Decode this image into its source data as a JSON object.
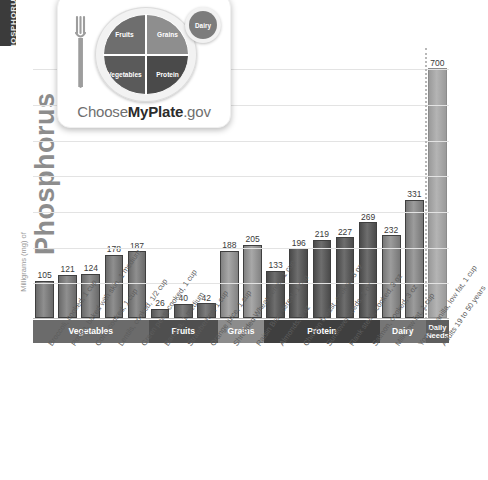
{
  "side_tab": {
    "label": "PHOSPHORUS"
  },
  "axis": {
    "y_title_main": "Phosphorus",
    "y_title_small": "Milligrams (mg) of",
    "y_max": 760,
    "gridline_step": 100,
    "gridlines": [
      100,
      200,
      300,
      400,
      500,
      600,
      700
    ]
  },
  "logo": {
    "fork_icon": "fork-icon",
    "wordmark_prefix": "Choose",
    "wordmark_bold": "MyPlate",
    "wordmark_suffix": ".gov",
    "segments": [
      {
        "name": "Fruits",
        "color": "#6e6e6e"
      },
      {
        "name": "Grains",
        "color": "#8e8e8e"
      },
      {
        "name": "Vegetables",
        "color": "#5a5a5a"
      },
      {
        "name": "Protein",
        "color": "#4a4a4a"
      },
      {
        "name": "Dairy",
        "color": "#7c7c7c"
      }
    ]
  },
  "groups": [
    {
      "label": "Vegetables",
      "count": 5,
      "color": "#6b6b6b",
      "bar_color_top": "#8f8f8f",
      "bar_color_bottom": "#6a6a6a"
    },
    {
      "label": "Fruits",
      "count": 3,
      "color": "#4f4f4f",
      "bar_color_top": "#7c7c7c",
      "bar_color_bottom": "#585858"
    },
    {
      "label": "Grains",
      "count": 2,
      "color": "#8c8c8c",
      "bar_color_top": "#a8a8a8",
      "bar_color_bottom": "#828282"
    },
    {
      "label": "Protein",
      "count": 5,
      "color": "#3f3f3f",
      "bar_color_top": "#6e6e6e",
      "bar_color_bottom": "#4a4a4a"
    },
    {
      "label": "Dairy",
      "count": 2,
      "color": "#767676",
      "bar_color_top": "#9c9c9c",
      "bar_color_bottom": "#777777"
    },
    {
      "label": "Daily\nNeeds",
      "count": 1,
      "color": "#5e5e5e",
      "bar_color_top": "#b4b4b4",
      "bar_color_bottom": "#9a9a9a"
    }
  ],
  "chart_data": {
    "type": "bar",
    "title": "Phosphorus",
    "xlabel": "",
    "ylabel": "Milligrams (mg) of Phosphorus",
    "ylim": [
      0,
      760
    ],
    "grid": true,
    "legend": "none",
    "categories": [
      "Broccoli, cooked, 1 cup",
      "Potato, baked with skin, 1 medium",
      "Corn, cooked, 1 cup",
      "Lentils, cooked, 1/2 cup",
      "Green peas, cooked, 1 cup",
      "Banana, 1 medium",
      "Strawberries, 1 cup",
      "Orange juice, 1 cup",
      "Shredded Wheat cereal, 1 cup",
      "Raisin Bran cereal, 1 cup",
      "Almonds, 1 oz",
      "Chicken breast, cooked, 3 oz",
      "Sunflower seeds, 1 oz",
      "Flank steak, cooked, 3 oz",
      "Salmon, cooked, 3 oz",
      "Milk, low fat, 1 cup",
      "Yogurt, vanilla, low fat, 1 cup",
      "Adults 19 to 50 years"
    ],
    "values": [
      105,
      121,
      124,
      178,
      187,
      26,
      40,
      42,
      188,
      205,
      133,
      196,
      219,
      227,
      269,
      232,
      331,
      700
    ],
    "group_of_bar": [
      "Vegetables",
      "Vegetables",
      "Vegetables",
      "Vegetables",
      "Vegetables",
      "Fruits",
      "Fruits",
      "Fruits",
      "Grains",
      "Grains",
      "Protein",
      "Protein",
      "Protein",
      "Protein",
      "Protein",
      "Dairy",
      "Dairy",
      "Daily Needs"
    ]
  }
}
